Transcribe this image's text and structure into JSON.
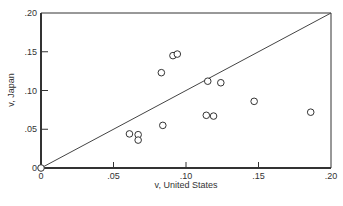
{
  "chart_data": {
    "type": "scatter",
    "title": "",
    "xlabel": "v, United States",
    "ylabel": "v, Japan",
    "xlim": [
      0,
      0.2
    ],
    "ylim": [
      0,
      0.2
    ],
    "x_ticks": [
      0,
      0.05,
      0.1,
      0.15,
      0.2
    ],
    "y_ticks": [
      0,
      0.05,
      0.1,
      0.15,
      0.2
    ],
    "x_tick_labels": [
      "0",
      ".05",
      ".10",
      ".15",
      ".20"
    ],
    "y_tick_labels": [
      "0",
      ".05",
      ".10",
      ".15",
      ".20"
    ],
    "grid": false,
    "legend": null,
    "reference_line": {
      "type": "y=x",
      "from": [
        0,
        0
      ],
      "to": [
        0.2,
        0.2
      ]
    },
    "marker": "open-circle",
    "series": [
      {
        "name": "observations",
        "points": [
          {
            "x": 0.0,
            "y": 0.0
          },
          {
            "x": 0.061,
            "y": 0.044
          },
          {
            "x": 0.067,
            "y": 0.043
          },
          {
            "x": 0.067,
            "y": 0.036
          },
          {
            "x": 0.084,
            "y": 0.055
          },
          {
            "x": 0.083,
            "y": 0.123
          },
          {
            "x": 0.091,
            "y": 0.145
          },
          {
            "x": 0.094,
            "y": 0.147
          },
          {
            "x": 0.115,
            "y": 0.112
          },
          {
            "x": 0.124,
            "y": 0.11
          },
          {
            "x": 0.114,
            "y": 0.068
          },
          {
            "x": 0.119,
            "y": 0.067
          },
          {
            "x": 0.147,
            "y": 0.086
          },
          {
            "x": 0.186,
            "y": 0.072
          }
        ]
      }
    ]
  },
  "layout": {
    "plot": {
      "left": 41,
      "right": 331,
      "top": 13,
      "bottom": 168
    },
    "colors": {
      "axis": "#333333",
      "marker_stroke": "#333333",
      "marker_fill": "#ffffff",
      "line": "#444444"
    }
  }
}
